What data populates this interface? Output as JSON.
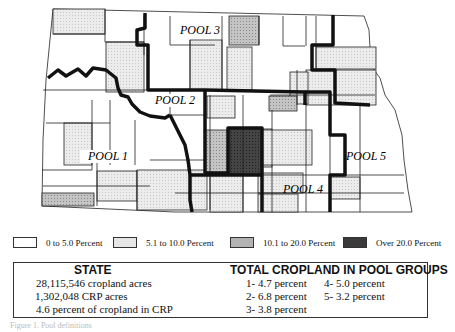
{
  "map": {
    "pool_labels": [
      {
        "id": 1,
        "text": "POOL 1"
      },
      {
        "id": 2,
        "text": "POOL 2"
      },
      {
        "id": 3,
        "text": "POOL 3"
      },
      {
        "id": 4,
        "text": "POOL 4"
      },
      {
        "id": 5,
        "text": "POOL 5"
      }
    ],
    "colors": {
      "class_0_5": "#ffffff",
      "class_5_10": "#e6e6e6",
      "class_10_20": "#b3b3b3",
      "class_over_20": "#3a3a3a",
      "border": "#111111"
    }
  },
  "legend": [
    {
      "label": "0 to 5.0 Percent",
      "color": "#ffffff"
    },
    {
      "label": "5.1 to 10.0 Percent",
      "color": "#e6e6e6"
    },
    {
      "label": "10.1 to 20.0 Percent",
      "color": "#b3b3b3"
    },
    {
      "label": "Over 20.0 Percent",
      "color": "#3a3a3a"
    }
  ],
  "state": {
    "title": "STATE",
    "lines": [
      "28,115,546 cropland acres",
      "1,302,048 CRP acres",
      "4.6 percent of cropland in CRP"
    ]
  },
  "pools": {
    "title": "TOTAL CROPLAND IN POOL GROUPS",
    "items": [
      "1- 4.7 percent",
      "2- 6.8 percent",
      "3- 3.8 percent",
      "4- 5.0 percent",
      "5- 3.2 percent"
    ]
  },
  "caption": "Figure 1. Pool definitions"
}
